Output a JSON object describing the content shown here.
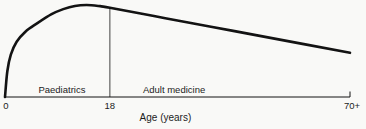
{
  "figure": {
    "background": "#f9f9f7",
    "line_color": "#131313",
    "text_color": "#1c1c1c"
  },
  "chart_data": {
    "type": "line",
    "title": "",
    "xlabel": "Age (years)",
    "ylabel": "",
    "ylim": [
      0,
      1
    ],
    "grid": false,
    "legend": "none",
    "x_ticks": [
      {
        "label": "0",
        "age": 0,
        "frac": 0.0
      },
      {
        "label": "18",
        "age": 18,
        "frac": 0.304
      },
      {
        "label": "70+",
        "age": 70,
        "frac": 1.0
      }
    ],
    "regions": [
      {
        "label": "Paediatrics",
        "from_age": 0,
        "to_age": 18,
        "label_frac": 0.165
      },
      {
        "label": "Adult medicine",
        "from_age": 18,
        "to_age": 70,
        "label_frac": 0.49
      }
    ],
    "divider_age": 18,
    "series": [
      {
        "name": "curve",
        "points": [
          [
            0,
            0.0
          ],
          [
            0.4,
            0.28
          ],
          [
            1,
            0.46
          ],
          [
            2,
            0.6
          ],
          [
            3.5,
            0.71
          ],
          [
            5.5,
            0.8
          ],
          [
            8,
            0.9
          ],
          [
            10,
            0.955
          ],
          [
            12,
            0.99
          ],
          [
            14,
            1.0
          ],
          [
            16,
            0.99
          ],
          [
            18,
            0.97
          ],
          [
            30,
            0.857
          ],
          [
            45,
            0.716
          ],
          [
            60,
            0.575
          ],
          [
            70,
            0.48
          ]
        ]
      }
    ]
  }
}
